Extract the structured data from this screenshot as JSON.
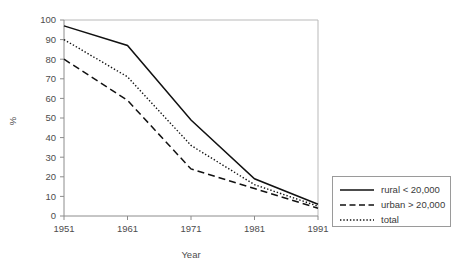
{
  "chart_data": {
    "type": "line",
    "title": "",
    "subtitle": "",
    "xlabel": "Year",
    "ylabel": "%",
    "x": [
      1951,
      1961,
      1971,
      1981,
      1991
    ],
    "xticklabels": [
      "1951",
      "1961",
      "1971",
      "1981",
      "1991"
    ],
    "yticklabels": [
      "0",
      "10",
      "20",
      "30",
      "40",
      "50",
      "60",
      "70",
      "80",
      "90",
      "100"
    ],
    "yticks": [
      0,
      10,
      20,
      30,
      40,
      50,
      60,
      70,
      80,
      90,
      100
    ],
    "xlim": [
      1951,
      1991
    ],
    "ylim": [
      0,
      100
    ],
    "grid": false,
    "legend_position": "bottom-right",
    "series": [
      {
        "name": "rural < 20,000",
        "style": "solid",
        "color": "#111111",
        "values": [
          97,
          87,
          49,
          19,
          6
        ]
      },
      {
        "name": "urban > 20,000",
        "style": "dashed",
        "color": "#111111",
        "values": [
          80,
          59,
          24,
          14,
          4
        ]
      },
      {
        "name": "total",
        "style": "dotted",
        "color": "#111111",
        "values": [
          90,
          71,
          36,
          16,
          5
        ]
      }
    ]
  },
  "axes": {
    "x_title": "Year",
    "y_title": "%"
  },
  "legend": {
    "entries": [
      {
        "label": "rural < 20,000",
        "style": "solid"
      },
      {
        "label": "urban > 20,000",
        "style": "dashed"
      },
      {
        "label": "total",
        "style": "dotted"
      }
    ]
  },
  "colors": {
    "line": "#111111",
    "axis": "#8c8c8c",
    "frame": "#b9b9b9",
    "text": "#4d4d4d",
    "background": "#ffffff"
  }
}
